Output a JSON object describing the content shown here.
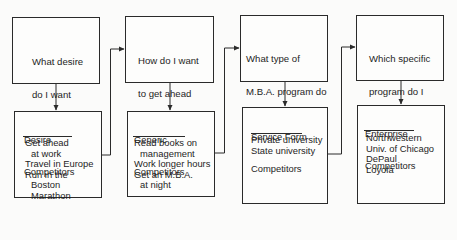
{
  "diagram": {
    "type": "flowchart",
    "columns": [
      {
        "question": [
          "What desire",
          "do I want",
          "to satisfy?"
        ],
        "competitor_heading": [
          "Desire",
          "Competitors"
        ],
        "competitors": [
          {
            "text": "Get ahead",
            "indent": false
          },
          {
            "text": "at work",
            "indent": true
          },
          {
            "text": "Travel in Europe",
            "indent": false
          },
          {
            "text": "Run in the",
            "indent": false
          },
          {
            "text": "Boston",
            "indent": true
          },
          {
            "text": "Marathon",
            "indent": true
          }
        ]
      },
      {
        "question": [
          "How do I want",
          "to get ahead",
          "at work?"
        ],
        "competitor_heading": [
          "Generic",
          "Competitors"
        ],
        "competitors": [
          {
            "text": "Read books on",
            "indent": false
          },
          {
            "text": "management",
            "indent": true
          },
          {
            "text": "Work longer hours",
            "indent": false
          },
          {
            "text": "Get an M.B.A.",
            "indent": false
          },
          {
            "text": "at night",
            "indent": true
          }
        ]
      },
      {
        "question": [
          "What type of",
          "M.B.A. program do",
          "I want to attend?"
        ],
        "competitor_heading": [
          "Service Form",
          "Competitors"
        ],
        "competitors": [
          {
            "text": "Private university",
            "indent": false
          },
          {
            "text": "State university",
            "indent": false
          }
        ]
      },
      {
        "question": [
          "Which specific",
          "program do I",
          "want to attend?"
        ],
        "competitor_heading": [
          "Enterprise",
          "Competitors"
        ],
        "competitors": [
          {
            "text": "Northwestern",
            "indent": false
          },
          {
            "text": "Univ. of Chicago",
            "indent": false
          },
          {
            "text": "DePaul",
            "indent": false
          },
          {
            "text": "Loyola",
            "indent": false
          }
        ]
      }
    ]
  },
  "colors": {
    "line": "#2a2a2a",
    "text": "#1e1e1e",
    "background": "#fbfbfa"
  }
}
